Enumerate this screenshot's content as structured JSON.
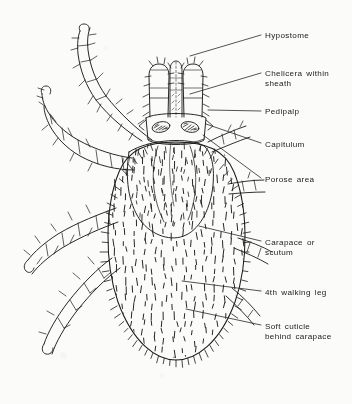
{
  "figure": {
    "ink_color": "#1b1b1b",
    "paper_color": "#fbfbf9",
    "labels": [
      {
        "id": "hypostome",
        "text": "Hypostome",
        "x": 265,
        "y": 31,
        "leader": {
          "x1": 261,
          "y1": 35,
          "x2": 190,
          "y2": 56
        }
      },
      {
        "id": "chelicera",
        "text": "Chelicera within\nsheath",
        "x": 265,
        "y": 69,
        "leader": {
          "x1": 261,
          "y1": 73,
          "x2": 190,
          "y2": 94
        }
      },
      {
        "id": "pedipalp",
        "text": "Pedipalp",
        "x": 265,
        "y": 107,
        "leader": {
          "x1": 261,
          "y1": 111,
          "x2": 208,
          "y2": 110
        }
      },
      {
        "id": "capitulum",
        "text": "Capitulum",
        "x": 265,
        "y": 140,
        "leader": {
          "x1": 261,
          "y1": 143,
          "x2": 206,
          "y2": 124
        }
      },
      {
        "id": "porose-area",
        "text": "Porose area",
        "x": 265,
        "y": 175,
        "leader": {
          "x1": 261,
          "y1": 178,
          "x2": 203,
          "y2": 135
        }
      },
      {
        "id": "carapace",
        "text": "Carapace  or\nscutum",
        "x": 265,
        "y": 238,
        "leader": {
          "x1": 261,
          "y1": 241,
          "x2": 199,
          "y2": 226
        }
      },
      {
        "id": "fourth-walking-leg",
        "text": "4th walking leg",
        "x": 265,
        "y": 288,
        "leader": {
          "x1": 261,
          "y1": 291,
          "x2": 182,
          "y2": 281
        }
      },
      {
        "id": "soft-cuticle",
        "text": "Soft cuticle\nbehind carapace",
        "x": 265,
        "y": 322,
        "leader": {
          "x1": 261,
          "y1": 325,
          "x2": 186,
          "y2": 309
        }
      }
    ],
    "anatomy": {
      "capitulum": "basis capituli with paired porose areas",
      "palps": "two lateral pedipalps flanking central hypostome",
      "scutum": "shield covering anterior dorsum",
      "idiosoma": "large oval body with dense setae",
      "legs": "four pairs of segmented bristled legs"
    }
  }
}
